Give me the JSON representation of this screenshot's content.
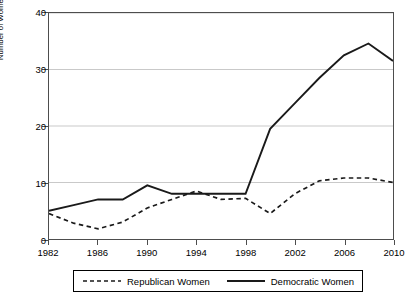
{
  "chart_data": {
    "type": "line",
    "title": "",
    "xlabel": "",
    "ylabel": "Number of Women with 4+ Terms in Office",
    "xlim": [
      1982,
      2010
    ],
    "ylim": [
      0,
      40
    ],
    "yticks": [
      0,
      10,
      20,
      30,
      40
    ],
    "xticks": [
      1982,
      1986,
      1990,
      1994,
      1998,
      2002,
      2006,
      2010
    ],
    "grid": true,
    "legend_position": "below-axes",
    "x": [
      1982,
      1984,
      1986,
      1988,
      1990,
      1992,
      1994,
      1996,
      1998,
      2000,
      2002,
      2004,
      2006,
      2008,
      2010
    ],
    "series": [
      {
        "name": "Republican Women",
        "style": "dashed",
        "color": "#1a1a1a",
        "values": [
          4.5,
          2.8,
          1.8,
          3.0,
          5.5,
          7.0,
          8.5,
          7.0,
          7.2,
          4.5,
          8.0,
          10.3,
          10.8,
          10.8,
          10.0
        ]
      },
      {
        "name": "Democratic Women",
        "style": "solid",
        "color": "#1a1a1a",
        "values": [
          5.0,
          6.0,
          7.0,
          7.0,
          9.5,
          8.0,
          8.0,
          8.0,
          8.0,
          19.5,
          24.0,
          28.5,
          32.5,
          34.6,
          31.5
        ]
      }
    ]
  },
  "axes": {
    "y_title": "Number of Women with 4+ Terms in Office",
    "y_labels": [
      "0",
      "10",
      "20",
      "30",
      "40"
    ],
    "x_labels": [
      "1982",
      "1986",
      "1990",
      "1994",
      "1998",
      "2002",
      "2006",
      "2010"
    ]
  },
  "legend": {
    "entries": [
      {
        "label": "Republican Women",
        "style": "dashed"
      },
      {
        "label": "Democratic Women",
        "style": "solid"
      }
    ]
  }
}
